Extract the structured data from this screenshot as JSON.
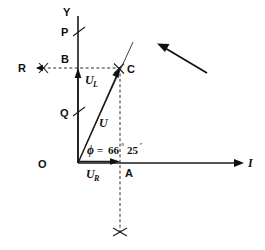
{
  "figure": {
    "type": "phasor-vector-diagram",
    "background_color": "#ffffff",
    "line_color": "#1a1a1a"
  },
  "axes": {
    "vertical": {
      "label": "Y",
      "origin_label": "O",
      "from": [
        78,
        163
      ],
      "to": [
        78,
        16
      ]
    },
    "horizontal": {
      "label": "I",
      "from": [
        78,
        163
      ],
      "to": [
        243,
        163
      ]
    }
  },
  "points": [
    {
      "name": "O",
      "label": "O",
      "x": 78,
      "y": 163
    },
    {
      "name": "P",
      "label": "P",
      "x": 78,
      "y": 33
    },
    {
      "name": "B",
      "label": "B",
      "x": 78,
      "y": 68
    },
    {
      "name": "Q",
      "label": "Q",
      "x": 78,
      "y": 113
    },
    {
      "name": "C",
      "label": "C",
      "x": 120,
      "y": 68
    },
    {
      "name": "A",
      "label": "A",
      "x": 120,
      "y": 163
    },
    {
      "name": "R",
      "label": "R",
      "x": 31,
      "y": 68
    }
  ],
  "vectors": [
    {
      "name": "U_L",
      "label": "U",
      "subscript": "L",
      "direction": "up",
      "from": [
        78,
        163
      ],
      "to": [
        78,
        68
      ]
    },
    {
      "name": "U_R",
      "label": "U",
      "subscript": "R",
      "direction": "right",
      "from": [
        78,
        163
      ],
      "to": [
        120,
        163
      ]
    },
    {
      "name": "U",
      "label": "U",
      "subscript": "",
      "direction": "diagonal",
      "from": [
        78,
        163
      ],
      "to": [
        120,
        68
      ]
    }
  ],
  "angle": {
    "symbol": "ϕ",
    "equals": "=",
    "degrees": "66",
    "degree_symbol": "°",
    "minutes": "25",
    "minute_symbol": "′",
    "full_text": "ϕ = 66° 25′",
    "vertex": "O"
  },
  "construction": {
    "dashed_horizontal": {
      "from": [
        37,
        68
      ],
      "to": [
        120,
        68
      ],
      "arrow_at": "left"
    },
    "dashed_vertical": {
      "from": [
        120,
        68
      ],
      "to": [
        120,
        232
      ]
    },
    "cross_marks": [
      {
        "name": "cross-at-R",
        "x": 43,
        "y": 68
      },
      {
        "name": "cross-at-C",
        "x": 119,
        "y": 68
      },
      {
        "name": "cross-below-A",
        "x": 120,
        "y": 232
      }
    ],
    "extension_line": {
      "from": [
        78,
        163
      ],
      "to": [
        133,
        42
      ]
    }
  },
  "rotation_arrow": {
    "name": "rotation-direction-arrow",
    "from": [
      207,
      73
    ],
    "to": [
      158,
      44
    ],
    "meaning": "counter-clockwise rotation direction"
  },
  "tick_marks": [
    {
      "name": "tick-P",
      "at_point": "P"
    },
    {
      "name": "tick-Q",
      "at_point": "Q"
    }
  ]
}
